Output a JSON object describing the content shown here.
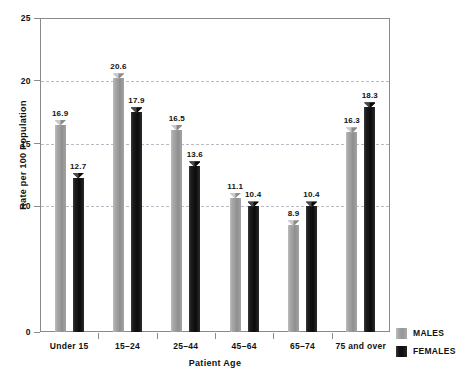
{
  "chart_data": {
    "type": "bar",
    "title": "",
    "xlabel": "Patient Age",
    "ylabel": "Rate per 100 Population",
    "categories": [
      "Under 15",
      "15–24",
      "25–44",
      "45–64",
      "65–74",
      "75 and over"
    ],
    "series": [
      {
        "name": "MALES",
        "color": "#9a9a9a",
        "values": [
          16.9,
          20.6,
          16.5,
          11.1,
          8.9,
          16.3
        ]
      },
      {
        "name": "FEMALES",
        "color": "#111111",
        "values": [
          12.7,
          17.9,
          13.6,
          10.4,
          10.4,
          18.3
        ]
      }
    ],
    "value_labels": {
      "MALES": [
        "16.9",
        "20.6",
        "16.5",
        "11.1",
        "8.9",
        "16.3"
      ],
      "FEMALES": [
        "12.7",
        "17.9",
        "13.6",
        "10.4",
        "10.4",
        "18.3"
      ]
    },
    "ylim": [
      0,
      25
    ],
    "yticks": [
      0,
      10,
      15,
      20,
      25
    ],
    "ytick_labels": [
      "0",
      "10",
      "15",
      "20",
      "25"
    ],
    "gridlines": [
      10,
      15,
      20
    ],
    "grid": true,
    "legend_position": "bottom-right",
    "legend": [
      "MALES",
      "FEMALES"
    ]
  },
  "axes": {
    "y_title": "Rate per 100 Population",
    "x_title": "Patient Age"
  },
  "legend": {
    "males_label": "MALES",
    "females_label": "FEMALES"
  }
}
